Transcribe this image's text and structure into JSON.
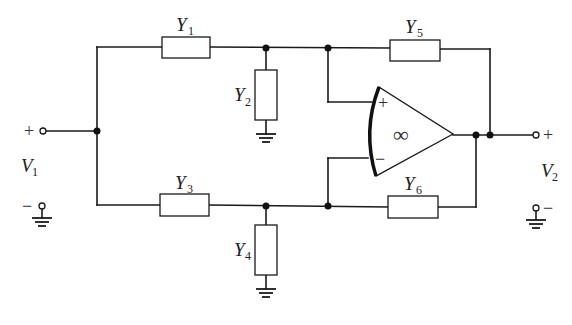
{
  "diagram": {
    "type": "circuit-schematic",
    "components": {
      "Y1": {
        "name": "Y",
        "sub": "1"
      },
      "Y2": {
        "name": "Y",
        "sub": "2"
      },
      "Y3": {
        "name": "Y",
        "sub": "3"
      },
      "Y4": {
        "name": "Y",
        "sub": "4"
      },
      "Y5": {
        "name": "Y",
        "sub": "5"
      },
      "Y6": {
        "name": "Y",
        "sub": "6"
      }
    },
    "ports": {
      "input": {
        "name": "V",
        "sub": "1",
        "plus": "+",
        "minus": "−"
      },
      "output": {
        "name": "V",
        "sub": "2",
        "plus": "+",
        "minus": "−"
      }
    },
    "opamp": {
      "gain_symbol": "∞",
      "noninverting": "+",
      "inverting": "−"
    }
  }
}
